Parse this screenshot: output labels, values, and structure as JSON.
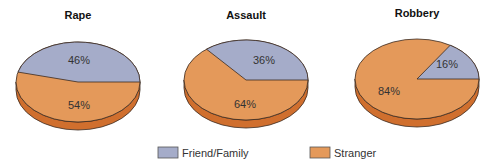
{
  "colors": {
    "friend_family": "#a5acc9",
    "stranger": "#e4995a",
    "stranger_side": "#d06f2e",
    "outline": "#3a2a20"
  },
  "legend": {
    "items": [
      {
        "label": "Friend/Family",
        "color": "#a5acc9"
      },
      {
        "label": "Stranger",
        "color": "#e4995a"
      }
    ]
  },
  "charts": [
    {
      "title": "Rape",
      "friend_family_label": "46%",
      "stranger_label": "54%"
    },
    {
      "title": "Assault",
      "friend_family_label": "36%",
      "stranger_label": "64%"
    },
    {
      "title": "Robbery",
      "friend_family_label": "16%",
      "stranger_label": "84%"
    }
  ],
  "chart_data": [
    {
      "type": "pie",
      "title": "Rape",
      "categories": [
        "Friend/Family",
        "Stranger"
      ],
      "values": [
        46,
        54
      ],
      "legend_position": "bottom"
    },
    {
      "type": "pie",
      "title": "Assault",
      "categories": [
        "Friend/Family",
        "Stranger"
      ],
      "values": [
        36,
        64
      ],
      "legend_position": "bottom"
    },
    {
      "type": "pie",
      "title": "Robbery",
      "categories": [
        "Friend/Family",
        "Stranger"
      ],
      "values": [
        16,
        84
      ],
      "legend_position": "bottom"
    }
  ]
}
